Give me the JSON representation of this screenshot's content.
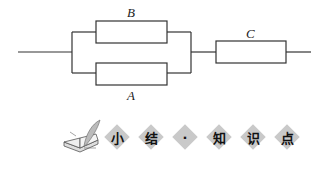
{
  "diagram": {
    "type": "circuit",
    "components": [
      {
        "id": "B",
        "label": "B",
        "position": "parallel-top"
      },
      {
        "id": "A",
        "label": "A",
        "position": "parallel-bottom"
      },
      {
        "id": "C",
        "label": "C",
        "position": "series"
      }
    ],
    "topology": "(A || B) in series with C"
  },
  "banner": {
    "icon": "book-quill-icon",
    "chars": [
      "小",
      "结",
      "·",
      "知",
      "识",
      "点"
    ]
  },
  "colors": {
    "line": "#333333",
    "diamond": "#c9c9c9"
  }
}
